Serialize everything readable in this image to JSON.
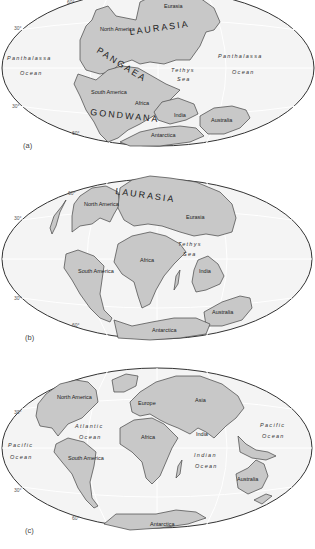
{
  "figure": {
    "colors": {
      "land": "#c8c8c8",
      "ocean": "#f4f4f4",
      "outline": "#333333"
    },
    "panels": [
      {
        "id": "a",
        "label": "(a)",
        "latitudes": [
          "60°",
          "30°",
          "30°",
          "60°"
        ],
        "supercontinents": [
          "LAURASIA",
          "PANGAEA",
          "GONDWANA"
        ],
        "landmasses": [
          "Eurasia",
          "North America",
          "South America",
          "Africa",
          "India",
          "Australia",
          "Antarctica"
        ],
        "oceans": {
          "west_line1": "Panthalassa",
          "west_line2": "Ocean",
          "east_line1": "Panthalassa",
          "east_line2": "Ocean",
          "sea_line1": "Tethys",
          "sea_line2": "Sea"
        }
      },
      {
        "id": "b",
        "label": "(b)",
        "latitudes": [
          "60°",
          "30°",
          "30°",
          "60°"
        ],
        "supercontinents": [
          "LAURASIA"
        ],
        "landmasses": [
          "North America",
          "Eurasia",
          "Africa",
          "South America",
          "India",
          "Australia",
          "Antarctica"
        ],
        "oceans": {
          "sea_line1": "Tethys",
          "sea_line2": "Sea"
        }
      },
      {
        "id": "c",
        "label": "(c)",
        "latitudes": [
          "30°",
          "30°",
          "60°"
        ],
        "landmasses": [
          "North America",
          "Europe",
          "Asia",
          "Africa",
          "India",
          "South America",
          "Australia",
          "Antarctica"
        ],
        "oceans": {
          "atl_line1": "Atlantic",
          "atl_line2": "Ocean",
          "pac_w_line1": "Pacific",
          "pac_w_line2": "Ocean",
          "pac_e_line1": "Pacific",
          "pac_e_line2": "Ocean",
          "ind_line1": "Indian",
          "ind_line2": "Ocean"
        }
      }
    ]
  }
}
